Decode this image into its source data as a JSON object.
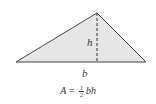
{
  "diagram": {
    "shape": "triangle",
    "fill_color": "#e6e6e6",
    "stroke_color": "#444444",
    "labels": {
      "height": "h",
      "base": "b"
    },
    "formula": {
      "lhs": "A",
      "equals": "=",
      "fraction_numerator": "1",
      "fraction_denominator": "2",
      "rhs_vars": "bh"
    }
  }
}
